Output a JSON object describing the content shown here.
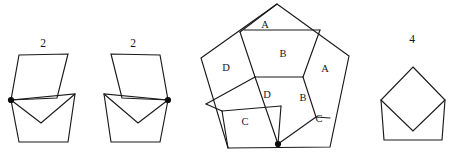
{
  "figure": {
    "background_color": "#ffffff",
    "stroke_color": "#1a1a1a",
    "text_color": "#161616",
    "width": 453,
    "height": 159
  },
  "count_labels": [
    {
      "id": "count-left",
      "text": "2",
      "x": 43,
      "y": 44
    },
    {
      "id": "count-mid",
      "text": "2",
      "x": 133,
      "y": 44
    },
    {
      "id": "count-right",
      "text": "4",
      "x": 412,
      "y": 40
    }
  ],
  "piece_labels": [
    {
      "id": "label-a-top",
      "text": "A",
      "x": 265,
      "y": 26
    },
    {
      "id": "label-b-top",
      "text": "B",
      "x": 283,
      "y": 55
    },
    {
      "id": "label-a-right",
      "text": "A",
      "x": 325,
      "y": 70
    },
    {
      "id": "label-d-left",
      "text": "D",
      "x": 226,
      "y": 69
    },
    {
      "id": "label-d-mid",
      "text": "D",
      "x": 267,
      "y": 96
    },
    {
      "id": "label-b-mid",
      "text": "B",
      "x": 303,
      "y": 99
    },
    {
      "id": "label-c-left",
      "text": "C",
      "x": 245,
      "y": 123
    },
    {
      "id": "label-c-right",
      "text": "C",
      "x": 319,
      "y": 120
    }
  ],
  "shapes": {
    "left_parallelogram": {
      "name": "left-parallelogram-piece",
      "points": "19,55 68,54 57,98 11,100"
    },
    "left_chevron_cup": {
      "name": "left-chevron-cup-piece",
      "points": "11,100 75,94 68,142 19,142"
    },
    "left_chevron_notch": {
      "name": "left-chevron-notch-edge",
      "points": "11,100 41,123 75,94"
    },
    "left_pivot_dot": {
      "name": "left-pivot-dot",
      "cx": 11,
      "cy": 100,
      "r": 3.1
    },
    "mid_parallelogram": {
      "name": "mid-parallelogram-piece",
      "points": "111,54 160,55 168,100 122,98"
    },
    "mid_chevron_cup": {
      "name": "mid-chevron-cup-piece",
      "points": "168,100 104,94 111,142 160,142"
    },
    "mid_chevron_notch": {
      "name": "mid-chevron-notch-edge",
      "points": "168,100 138,123 104,94"
    },
    "mid_pivot_dot": {
      "name": "mid-pivot-dot",
      "cx": 168,
      "cy": 100,
      "r": 3.1
    },
    "pentagon_outline": {
      "name": "pentagon-outer-outline",
      "points": "277,4 349,56 330,147 228,148 201,58"
    },
    "pentagon_cuts": [
      {
        "name": "cut-apex-to-center-left",
        "points": "240,32 255,77"
      },
      {
        "name": "cut-topedge-to-center",
        "points": "240,32 277,4"
      },
      {
        "name": "cut-b-top-edge",
        "points": "244,30 320,30"
      },
      {
        "name": "cut-b-right",
        "points": "320,30 303,77"
      },
      {
        "name": "cut-center-seam",
        "points": "255,77 303,77"
      },
      {
        "name": "cut-right-lower",
        "points": "303,77 316,117"
      },
      {
        "name": "cut-right-to-rim",
        "points": "316,117 330,118"
      },
      {
        "name": "cut-d-left",
        "points": "255,77 206,104"
      },
      {
        "name": "cut-c-top",
        "points": "206,104 222,111"
      },
      {
        "name": "cut-c-shelf",
        "points": "222,111 281,106"
      },
      {
        "name": "cut-d-right",
        "points": "281,106 278,144"
      },
      {
        "name": "cut-b-mid-left",
        "points": "255,77 278,144"
      },
      {
        "name": "cut-b-mid-right",
        "points": "278,144 316,117"
      },
      {
        "name": "cut-c-bottom-left",
        "points": "222,111 228,148"
      }
    ],
    "pentagon_pivot_dot": {
      "name": "pentagon-pivot-dot",
      "cx": 278,
      "cy": 144,
      "r": 3.1
    },
    "right_pentagon": {
      "name": "right-pentagon-outline",
      "points": "413,67 445,100 442,140 384,140 381,100"
    },
    "right_diamond": {
      "name": "right-inscribed-diamond",
      "points": "413,67 445,100 413,131 381,100"
    },
    "right_notch": {
      "name": "right-notch-edge",
      "points": "381,100 413,131 445,100"
    }
  }
}
